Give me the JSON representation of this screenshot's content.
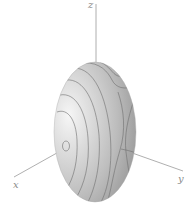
{
  "figure": {
    "axes": {
      "z": {
        "label": "z"
      },
      "x": {
        "label": "x"
      },
      "y": {
        "label": "y"
      }
    },
    "colors": {
      "background": "#ffffff",
      "axis": "#9a9a9a",
      "surface_highlight": "#f4f4f4",
      "surface_mid": "#c4c4c4",
      "surface_shadow": "#8e8e8e",
      "contour": "#6a6a6a"
    }
  }
}
